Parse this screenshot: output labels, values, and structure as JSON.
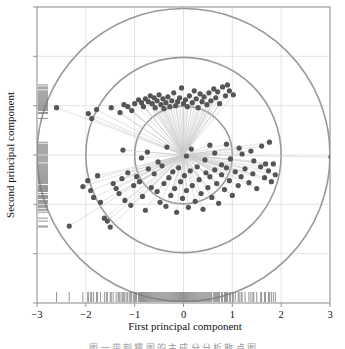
{
  "figure": {
    "background": "#ffffff",
    "frame_color": "#8a8a8a",
    "grid_color": "#d9d9d9",
    "circle_color": "#9a9a9a",
    "spoke_color": "#c9c9c9",
    "point_color": "#555555",
    "rug_color": "#7a7a7a",
    "caption": "图 一 带 刺 猬 图 的 主 成 分 分 析 散 点 图"
  },
  "chart_data": {
    "type": "scatter",
    "title": "",
    "xlabel": "First principal component",
    "ylabel": "Second principal component",
    "xlim": [
      -3,
      3
    ],
    "ylim": [
      -3,
      3
    ],
    "xticks": [
      -3,
      -2,
      -1,
      0,
      1,
      2,
      3
    ],
    "xticklabels": [
      "−3",
      "−2",
      "−1",
      "0",
      "1",
      "2",
      "3"
    ],
    "yticks": [
      -3,
      -2,
      -1,
      0,
      1,
      2,
      3
    ],
    "yticklabels": [
      "",
      "",
      "",
      "",
      "",
      "",
      ""
    ],
    "grid": true,
    "legend": "none",
    "annotations": {
      "reference_circles": {
        "center": [
          0,
          0
        ],
        "radii": [
          1,
          2,
          3
        ],
        "description": "three concentric reference circles centred on origin"
      },
      "spokes": {
        "origin": [
          0,
          0
        ],
        "description": "thin rays from origin to every data point (hedgehog / sunflower plot)"
      },
      "rug_x": "tick marks along bottom axis showing first-component marginal distribution",
      "rug_y": "tick marks along left axis showing second-component marginal distribution"
    },
    "x": [
      -2.6,
      -1.95,
      -1.88,
      -1.78,
      -1.48,
      -1.3,
      -1.22,
      -1.14,
      -1.06,
      -1.0,
      -0.92,
      -0.86,
      -0.82,
      -0.78,
      -0.72,
      -0.68,
      -0.64,
      -0.6,
      -0.58,
      -0.54,
      -0.5,
      -0.46,
      -0.42,
      -0.4,
      -0.36,
      -0.32,
      -0.28,
      -0.24,
      -0.2,
      -0.16,
      -0.12,
      -0.08,
      -0.04,
      0.0,
      0.04,
      0.08,
      0.12,
      0.18,
      0.22,
      0.26,
      0.3,
      0.34,
      0.38,
      0.42,
      0.48,
      0.52,
      0.56,
      0.62,
      0.66,
      0.7,
      0.74,
      0.8,
      0.86,
      0.9,
      0.94,
      1.02,
      -2.34,
      -2.06,
      -1.96,
      -1.9,
      -1.84,
      -1.76,
      -1.7,
      -1.62,
      -1.56,
      -1.5,
      -1.44,
      -1.38,
      -1.32,
      -1.26,
      -1.2,
      -1.14,
      -1.08,
      -1.02,
      -0.96,
      -0.9,
      -0.84,
      -0.78,
      -0.72,
      -0.66,
      -0.6,
      -0.54,
      -0.48,
      -0.44,
      -0.4,
      -0.36,
      -0.3,
      -0.26,
      -0.22,
      -0.18,
      -0.14,
      -0.1,
      -0.06,
      -0.02,
      0.02,
      0.06,
      0.1,
      0.14,
      0.18,
      0.24,
      0.28,
      0.32,
      0.36,
      0.4,
      0.46,
      0.5,
      0.54,
      0.58,
      0.64,
      0.68,
      0.72,
      0.78,
      0.84,
      0.88,
      0.94,
      1.0,
      1.06,
      1.12,
      1.18,
      1.26,
      1.34,
      1.42,
      1.5,
      1.58,
      1.66,
      1.74,
      1.8,
      1.84,
      1.88,
      3.02,
      0.88,
      1.14,
      1.38,
      1.6,
      1.76,
      0.64,
      0.96,
      1.2,
      1.44,
      1.68,
      -0.86,
      -0.52,
      0.06,
      0.44,
      0.78,
      -1.24,
      -0.74,
      -0.34,
      0.16,
      0.54
    ],
    "y": [
      0.96,
      0.84,
      0.74,
      0.92,
      0.96,
      0.86,
      1.02,
      0.98,
      0.9,
      1.04,
      1.12,
      1.06,
      0.98,
      1.14,
      1.08,
      1.2,
      1.04,
      1.16,
      0.96,
      1.1,
      1.22,
      1.02,
      1.14,
      0.94,
      1.06,
      1.18,
      0.98,
      1.1,
      1.26,
      1.0,
      1.08,
      1.16,
      1.36,
      1.04,
      1.12,
      0.98,
      1.2,
      1.06,
      1.3,
      1.14,
      0.96,
      1.24,
      1.08,
      1.18,
      1.02,
      1.26,
      1.1,
      1.34,
      1.16,
      1.28,
      1.04,
      1.38,
      1.2,
      1.42,
      1.3,
      1.22,
      -1.44,
      -0.64,
      -0.52,
      -0.72,
      -0.86,
      -0.42,
      -0.96,
      -1.28,
      -1.34,
      -1.46,
      -0.58,
      -0.68,
      -0.78,
      -0.48,
      -0.92,
      -0.36,
      -1.02,
      -0.62,
      -0.44,
      -0.54,
      -0.84,
      -1.12,
      -0.28,
      -0.66,
      -0.38,
      -0.74,
      -0.96,
      -0.22,
      -0.58,
      -1.04,
      -0.46,
      -0.82,
      -0.34,
      -0.68,
      -1.16,
      -0.26,
      -0.54,
      -0.88,
      -0.42,
      -0.72,
      -1.06,
      -0.32,
      -0.62,
      -0.94,
      -0.24,
      -0.5,
      -0.78,
      -1.1,
      -0.36,
      -0.66,
      -0.44,
      -0.86,
      -0.3,
      -0.58,
      -0.98,
      -0.4,
      -0.7,
      -0.26,
      -0.52,
      -0.82,
      -0.34,
      -0.62,
      -0.44,
      -0.28,
      -0.56,
      -0.38,
      -0.68,
      -0.24,
      -0.46,
      -0.32,
      -0.54,
      -0.18,
      -0.4,
      -0.04,
      0.22,
      0.14,
      0.08,
      0.18,
      0.26,
      0.04,
      -0.08,
      0.02,
      -0.12,
      -0.18,
      -0.06,
      -0.14,
      -0.02,
      -0.1,
      -0.2,
      0.1,
      0.06,
      0.16,
      0.12,
      0.2
    ],
    "rug_x_values": [
      -2.6,
      -2.34,
      -2.06,
      -1.96,
      -1.95,
      -1.9,
      -1.88,
      -1.84,
      -1.78,
      -1.76,
      -1.7,
      -1.62,
      -1.58,
      -1.56,
      -1.5,
      -1.48,
      -1.44,
      -1.38,
      -1.34,
      -1.32,
      -1.3,
      -1.26,
      -1.24,
      -1.22,
      -1.2,
      -1.16,
      -1.14,
      -1.1,
      -1.08,
      -1.06,
      -1.02,
      -1.0,
      -0.98,
      -0.96,
      -0.92,
      -0.9,
      -0.88,
      -0.86,
      -0.84,
      -0.82,
      -0.8,
      -0.78,
      -0.76,
      -0.74,
      -0.72,
      -0.7,
      -0.68,
      -0.66,
      -0.64,
      -0.62,
      -0.6,
      -0.58,
      -0.56,
      -0.54,
      -0.52,
      -0.5,
      -0.48,
      -0.46,
      -0.44,
      -0.42,
      -0.4,
      -0.38,
      -0.36,
      -0.34,
      -0.32,
      -0.3,
      -0.28,
      -0.26,
      -0.24,
      -0.22,
      -0.2,
      -0.18,
      -0.16,
      -0.14,
      -0.12,
      -0.1,
      -0.08,
      -0.06,
      -0.04,
      -0.02,
      0.0,
      0.02,
      0.04,
      0.06,
      0.08,
      0.1,
      0.12,
      0.14,
      0.16,
      0.18,
      0.2,
      0.22,
      0.24,
      0.26,
      0.28,
      0.3,
      0.32,
      0.34,
      0.36,
      0.38,
      0.4,
      0.42,
      0.44,
      0.46,
      0.48,
      0.5,
      0.52,
      0.54,
      0.56,
      0.58,
      0.62,
      0.64,
      0.66,
      0.68,
      0.7,
      0.72,
      0.74,
      0.78,
      0.8,
      0.84,
      0.86,
      0.88,
      0.9,
      0.94,
      0.96,
      1.0,
      1.02,
      1.06,
      1.12,
      1.14,
      1.18,
      1.2,
      1.26,
      1.34,
      1.38,
      1.42,
      1.44,
      1.5,
      1.58,
      1.6,
      1.66,
      1.68,
      1.74,
      1.76,
      1.8,
      1.84,
      1.88
    ],
    "rug_y_values": [
      1.42,
      1.38,
      1.36,
      1.34,
      1.3,
      1.28,
      1.26,
      1.24,
      1.22,
      1.2,
      1.18,
      1.16,
      1.14,
      1.12,
      1.1,
      1.08,
      1.06,
      1.04,
      1.02,
      1.0,
      0.98,
      0.96,
      0.94,
      0.92,
      0.9,
      0.86,
      0.84,
      0.74,
      0.26,
      0.22,
      0.2,
      0.18,
      0.16,
      0.14,
      0.12,
      0.1,
      0.08,
      0.06,
      0.04,
      0.02,
      -0.02,
      -0.04,
      -0.06,
      -0.08,
      -0.1,
      -0.12,
      -0.14,
      -0.18,
      -0.2,
      -0.22,
      -0.24,
      -0.26,
      -0.28,
      -0.3,
      -0.32,
      -0.34,
      -0.36,
      -0.38,
      -0.4,
      -0.42,
      -0.44,
      -0.46,
      -0.48,
      -0.5,
      -0.52,
      -0.54,
      -0.56,
      -0.58,
      -0.62,
      -0.64,
      -0.66,
      -0.68,
      -0.7,
      -0.72,
      -0.74,
      -0.78,
      -0.82,
      -0.84,
      -0.86,
      -0.88,
      -0.92,
      -0.94,
      -0.96,
      -0.98,
      -1.02,
      -1.04,
      -1.06,
      -1.1,
      -1.12,
      -1.16,
      -1.28,
      -1.34,
      -1.44,
      -1.46
    ]
  }
}
